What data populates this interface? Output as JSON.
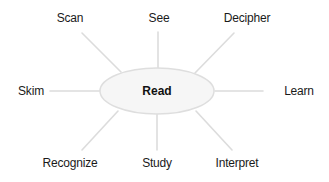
{
  "diagram": {
    "type": "hub-and-spoke",
    "center": {
      "label": "Read",
      "x": 157,
      "y": 91,
      "rx": 57,
      "ry": 23
    },
    "colors": {
      "line": "#dcdcdc",
      "hub_fill": "#f6f6f6",
      "hub_stroke": "#dedede",
      "text": "#1a1a1a"
    },
    "nodes": [
      {
        "label": "Scan",
        "x": 70,
        "y": 18,
        "line": [
          82,
          33,
          121,
          72
        ]
      },
      {
        "label": "See",
        "x": 159,
        "y": 18,
        "line": [
          158,
          32,
          158,
          68
        ]
      },
      {
        "label": "Decipher",
        "x": 247,
        "y": 18,
        "line": [
          234,
          33,
          195,
          73
        ]
      },
      {
        "label": "Skim",
        "x": 31,
        "y": 91,
        "line": [
          50,
          91,
          100,
          91
        ]
      },
      {
        "label": "Learn",
        "x": 299,
        "y": 91,
        "line": [
          215,
          91,
          263,
          91
        ]
      },
      {
        "label": "Recognize",
        "x": 70,
        "y": 163,
        "line": [
          118,
          111,
          82,
          150
        ]
      },
      {
        "label": "Study",
        "x": 157,
        "y": 163,
        "line": [
          157,
          114,
          157,
          150
        ]
      },
      {
        "label": "Interpret",
        "x": 237,
        "y": 163,
        "line": [
          196,
          111,
          232,
          150
        ]
      }
    ]
  }
}
